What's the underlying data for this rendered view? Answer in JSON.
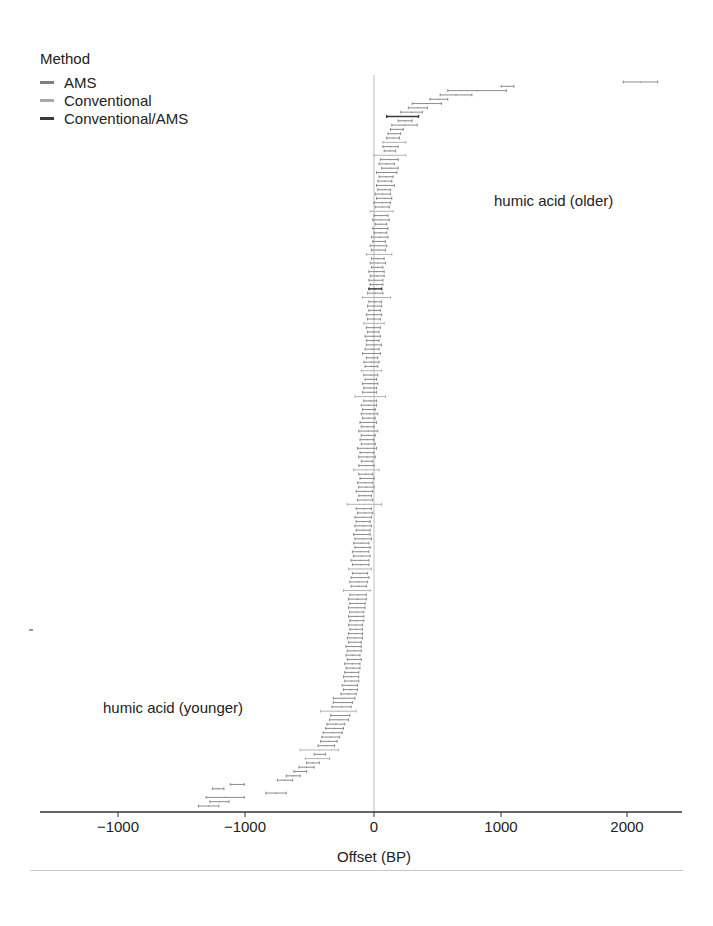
{
  "legend": {
    "title": "Method",
    "items": [
      {
        "label": "AMS",
        "color": "#7f7f7f"
      },
      {
        "label": "Conventional",
        "color": "#a9a9a9"
      },
      {
        "label": "Conventional/AMS",
        "color": "#3a3a3a"
      }
    ]
  },
  "annotations": {
    "older": "humic acid (older)",
    "younger": "humic acid (younger)"
  },
  "axis": {
    "x_title": "Offset (BP)",
    "tick_labels": [
      "−1000",
      "−1000",
      "0",
      "1000",
      "2000"
    ]
  },
  "chart_data": {
    "type": "errorbar-interval",
    "title": "",
    "xlabel": "Offset (BP)",
    "ylabel": "",
    "xlim": [
      -1620,
      2430
    ],
    "x_ticks": [
      -2000,
      -1000,
      0,
      1000,
      2000
    ],
    "x_tick_labels": [
      "−1000",
      "−1000",
      "0",
      "1000",
      "2000"
    ],
    "reference_line_x": 0,
    "grid": false,
    "legend_position": "top-left",
    "legend_title": "Method",
    "series_names": [
      "AMS",
      "Conventional",
      "Conventional/AMS"
    ],
    "annotations": [
      {
        "text": "humic acid (older)",
        "x": 1900,
        "y_fraction": 0.16
      },
      {
        "text": "humic acid (younger)",
        "x": -1060,
        "y_fraction": 0.86
      }
    ],
    "intervals_top_to_bottom": [
      [
        1960,
        2230,
        "AMS"
      ],
      [
        1000,
        1100,
        "AMS"
      ],
      [
        580,
        1040,
        "AMS"
      ],
      [
        520,
        770,
        "AMS"
      ],
      [
        440,
        580,
        "AMS"
      ],
      [
        300,
        530,
        "AMS"
      ],
      [
        270,
        420,
        "AMS"
      ],
      [
        210,
        380,
        "AMS"
      ],
      [
        100,
        350,
        "Conventional/AMS"
      ],
      [
        190,
        300,
        "AMS"
      ],
      [
        140,
        340,
        "AMS"
      ],
      [
        130,
        230,
        "AMS"
      ],
      [
        110,
        210,
        "AMS"
      ],
      [
        100,
        200,
        "AMS"
      ],
      [
        70,
        250,
        "Conventional"
      ],
      [
        70,
        190,
        "AMS"
      ],
      [
        80,
        170,
        "AMS"
      ],
      [
        0,
        250,
        "Conventional"
      ],
      [
        50,
        190,
        "AMS"
      ],
      [
        40,
        160,
        "AMS"
      ],
      [
        60,
        190,
        "AMS"
      ],
      [
        20,
        180,
        "AMS"
      ],
      [
        40,
        150,
        "AMS"
      ],
      [
        30,
        140,
        "AMS"
      ],
      [
        20,
        160,
        "AMS"
      ],
      [
        30,
        130,
        "AMS"
      ],
      [
        10,
        130,
        "AMS"
      ],
      [
        20,
        140,
        "AMS"
      ],
      [
        0,
        130,
        "AMS"
      ],
      [
        10,
        120,
        "AMS"
      ],
      [
        -30,
        150,
        "Conventional"
      ],
      [
        0,
        110,
        "AMS"
      ],
      [
        -10,
        120,
        "AMS"
      ],
      [
        10,
        100,
        "AMS"
      ],
      [
        -10,
        110,
        "AMS"
      ],
      [
        0,
        100,
        "AMS"
      ],
      [
        -20,
        110,
        "AMS"
      ],
      [
        -10,
        90,
        "AMS"
      ],
      [
        -30,
        100,
        "AMS"
      ],
      [
        -20,
        90,
        "AMS"
      ],
      [
        -60,
        140,
        "Conventional"
      ],
      [
        -20,
        80,
        "AMS"
      ],
      [
        -30,
        90,
        "AMS"
      ],
      [
        -20,
        70,
        "AMS"
      ],
      [
        -40,
        80,
        "AMS"
      ],
      [
        -30,
        80,
        "AMS"
      ],
      [
        -40,
        70,
        "AMS"
      ],
      [
        -30,
        70,
        "AMS"
      ],
      [
        -40,
        60,
        "Conventional/AMS"
      ],
      [
        -50,
        70,
        "AMS"
      ],
      [
        -90,
        130,
        "Conventional"
      ],
      [
        -40,
        60,
        "AMS"
      ],
      [
        -50,
        60,
        "AMS"
      ],
      [
        -40,
        50,
        "AMS"
      ],
      [
        -60,
        60,
        "AMS"
      ],
      [
        -50,
        50,
        "AMS"
      ],
      [
        -80,
        80,
        "Conventional"
      ],
      [
        -60,
        50,
        "AMS"
      ],
      [
        -50,
        40,
        "AMS"
      ],
      [
        -70,
        50,
        "AMS"
      ],
      [
        -60,
        40,
        "AMS"
      ],
      [
        -60,
        60,
        "AMS"
      ],
      [
        -70,
        40,
        "AMS"
      ],
      [
        -90,
        50,
        "AMS"
      ],
      [
        -60,
        30,
        "AMS"
      ],
      [
        -80,
        40,
        "AMS"
      ],
      [
        -70,
        30,
        "AMS"
      ],
      [
        -100,
        60,
        "Conventional"
      ],
      [
        -80,
        30,
        "AMS"
      ],
      [
        -70,
        20,
        "AMS"
      ],
      [
        -90,
        30,
        "AMS"
      ],
      [
        -80,
        20,
        "AMS"
      ],
      [
        -90,
        20,
        "AMS"
      ],
      [
        -150,
        90,
        "Conventional"
      ],
      [
        -80,
        20,
        "AMS"
      ],
      [
        -100,
        20,
        "AMS"
      ],
      [
        -90,
        10,
        "AMS"
      ],
      [
        -100,
        30,
        "AMS"
      ],
      [
        -90,
        10,
        "AMS"
      ],
      [
        -110,
        20,
        "AMS"
      ],
      [
        -100,
        0,
        "AMS"
      ],
      [
        -120,
        30,
        "AMS"
      ],
      [
        -100,
        10,
        "AMS"
      ],
      [
        -110,
        0,
        "AMS"
      ],
      [
        -100,
        10,
        "AMS"
      ],
      [
        -130,
        20,
        "AMS"
      ],
      [
        -110,
        0,
        "AMS"
      ],
      [
        -120,
        10,
        "AMS"
      ],
      [
        -100,
        -10,
        "AMS"
      ],
      [
        -120,
        0,
        "AMS"
      ],
      [
        -160,
        40,
        "Conventional"
      ],
      [
        -120,
        -10,
        "AMS"
      ],
      [
        -110,
        0,
        "AMS"
      ],
      [
        -130,
        -10,
        "AMS"
      ],
      [
        -120,
        0,
        "AMS"
      ],
      [
        -140,
        -10,
        "AMS"
      ],
      [
        -120,
        -20,
        "AMS"
      ],
      [
        -130,
        -10,
        "AMS"
      ],
      [
        -210,
        60,
        "Conventional"
      ],
      [
        -140,
        -20,
        "AMS"
      ],
      [
        -130,
        -10,
        "AMS"
      ],
      [
        -150,
        -20,
        "AMS"
      ],
      [
        -140,
        -30,
        "AMS"
      ],
      [
        -150,
        -20,
        "AMS"
      ],
      [
        -140,
        -30,
        "AMS"
      ],
      [
        -160,
        -30,
        "AMS"
      ],
      [
        -150,
        -20,
        "AMS"
      ],
      [
        -160,
        -40,
        "AMS"
      ],
      [
        -150,
        -30,
        "AMS"
      ],
      [
        -170,
        -40,
        "AMS"
      ],
      [
        -160,
        -30,
        "AMS"
      ],
      [
        -180,
        -40,
        "AMS"
      ],
      [
        -170,
        -40,
        "AMS"
      ],
      [
        -200,
        -20,
        "Conventional"
      ],
      [
        -170,
        -50,
        "AMS"
      ],
      [
        -180,
        -40,
        "AMS"
      ],
      [
        -190,
        -50,
        "AMS"
      ],
      [
        -180,
        -60,
        "AMS"
      ],
      [
        -240,
        -30,
        "Conventional"
      ],
      [
        -190,
        -60,
        "AMS"
      ],
      [
        -200,
        -60,
        "AMS"
      ],
      [
        -190,
        -70,
        "AMS"
      ],
      [
        -200,
        -70,
        "AMS"
      ],
      [
        -190,
        -80,
        "AMS"
      ],
      [
        -200,
        -80,
        "AMS"
      ],
      [
        -190,
        -80,
        "AMS"
      ],
      [
        -200,
        -90,
        "AMS"
      ],
      [
        -190,
        -90,
        "AMS"
      ],
      [
        -200,
        -90,
        "AMS"
      ],
      [
        -210,
        -90,
        "AMS"
      ],
      [
        -200,
        -100,
        "AMS"
      ],
      [
        -220,
        -100,
        "AMS"
      ],
      [
        -210,
        -100,
        "AMS"
      ],
      [
        -220,
        -110,
        "AMS"
      ],
      [
        -210,
        -100,
        "AMS"
      ],
      [
        -230,
        -110,
        "AMS"
      ],
      [
        -220,
        -110,
        "AMS"
      ],
      [
        -230,
        -120,
        "AMS"
      ],
      [
        -240,
        -120,
        "AMS"
      ],
      [
        -230,
        -120,
        "AMS"
      ],
      [
        -250,
        -130,
        "AMS"
      ],
      [
        -240,
        -130,
        "AMS"
      ],
      [
        -260,
        -140,
        "AMS"
      ],
      [
        -320,
        -150,
        "AMS"
      ],
      [
        -320,
        -170,
        "AMS"
      ],
      [
        -330,
        -180,
        "AMS"
      ],
      [
        -420,
        -140,
        "Conventional"
      ],
      [
        -340,
        -190,
        "AMS"
      ],
      [
        -350,
        -200,
        "AMS"
      ],
      [
        -370,
        -230,
        "AMS"
      ],
      [
        -380,
        -240,
        "AMS"
      ],
      [
        -400,
        -250,
        "AMS"
      ],
      [
        -410,
        -270,
        "AMS"
      ],
      [
        -420,
        -290,
        "AMS"
      ],
      [
        -440,
        -310,
        "AMS"
      ],
      [
        -580,
        -280,
        "Conventional"
      ],
      [
        -470,
        -380,
        "AMS"
      ],
      [
        -540,
        -350,
        "Conventional"
      ],
      [
        -530,
        -430,
        "AMS"
      ],
      [
        -590,
        -470,
        "AMS"
      ],
      [
        -630,
        -530,
        "AMS"
      ],
      [
        -690,
        -580,
        "AMS"
      ],
      [
        -760,
        -640,
        "AMS"
      ],
      [
        -1130,
        -1020,
        "AMS"
      ],
      [
        -1270,
        -1180,
        "AMS"
      ],
      [
        -850,
        -690,
        "AMS"
      ],
      [
        -1320,
        -1020,
        "AMS"
      ],
      [
        -1290,
        -1140,
        "AMS"
      ],
      [
        -1380,
        -1220,
        "AMS"
      ]
    ]
  }
}
